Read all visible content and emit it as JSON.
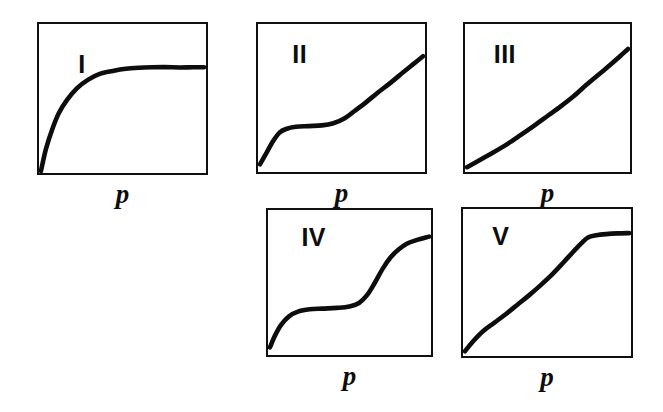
{
  "figure": {
    "background_color": "#ffffff",
    "line_color": "#0d0d0d",
    "width": 663,
    "height": 412
  },
  "panels": [
    {
      "id": "type-1",
      "label": "I",
      "axis_label": "p",
      "box": {
        "x": 37,
        "y": 22,
        "w": 171,
        "h": 153
      },
      "label_pos": {
        "x": 0.23,
        "y": 0.18
      },
      "axis_label_pos": {
        "x": 0.5,
        "y": 1.02
      }
    },
    {
      "id": "type-2",
      "label": "II",
      "axis_label": "p",
      "box": {
        "x": 256,
        "y": 22,
        "w": 171,
        "h": 152
      },
      "label_pos": {
        "x": 0.2,
        "y": 0.12
      },
      "axis_label_pos": {
        "x": 0.5,
        "y": 1.02
      }
    },
    {
      "id": "type-3",
      "label": "III",
      "axis_label": "p",
      "box": {
        "x": 463,
        "y": 22,
        "w": 169,
        "h": 152
      },
      "label_pos": {
        "x": 0.17,
        "y": 0.12
      },
      "axis_label_pos": {
        "x": 0.5,
        "y": 1.02
      }
    },
    {
      "id": "type-4",
      "label": "IV",
      "axis_label": "p",
      "box": {
        "x": 266,
        "y": 208,
        "w": 167,
        "h": 149
      },
      "label_pos": {
        "x": 0.2,
        "y": 0.1
      },
      "axis_label_pos": {
        "x": 0.5,
        "y": 1.02
      }
    },
    {
      "id": "type-5",
      "label": "V",
      "axis_label": "p",
      "box": {
        "x": 461,
        "y": 207,
        "w": 172,
        "h": 151
      },
      "label_pos": {
        "x": 0.17,
        "y": 0.1
      },
      "axis_label_pos": {
        "x": 0.5,
        "y": 1.02
      }
    }
  ],
  "chart_data": {
    "type": "line",
    "xlabel": "p",
    "ylabel": "",
    "xlim": [
      0,
      1
    ],
    "ylim": [
      0,
      1
    ],
    "grid": false,
    "legend": "none",
    "axis_tick_labels": {
      "x": [],
      "y": []
    },
    "annotations": [
      "I",
      "II",
      "III",
      "IV",
      "V"
    ],
    "series": [
      {
        "name": "Type I",
        "description": "Langmuir-type: steep initial uptake then horizontal plateau (microporous)",
        "x": [
          0.0,
          0.03,
          0.07,
          0.11,
          0.16,
          0.22,
          0.29,
          0.36,
          0.44,
          0.52,
          0.6,
          0.68,
          0.76,
          0.85,
          0.93,
          1.0
        ],
        "y": [
          0.0,
          0.15,
          0.29,
          0.4,
          0.49,
          0.57,
          0.63,
          0.67,
          0.69,
          0.705,
          0.712,
          0.715,
          0.716,
          0.714,
          0.715,
          0.715
        ]
      },
      {
        "name": "Type II",
        "description": "Sigmoidal with B-point knee then unrestricted multilayer rise (non-porous / macroporous)",
        "x": [
          0.0,
          0.04,
          0.08,
          0.12,
          0.16,
          0.22,
          0.3,
          0.38,
          0.45,
          0.52,
          0.58,
          0.65,
          0.72,
          0.8,
          0.88,
          0.94,
          1.0
        ],
        "y": [
          0.04,
          0.12,
          0.2,
          0.26,
          0.285,
          0.3,
          0.305,
          0.31,
          0.325,
          0.36,
          0.41,
          0.47,
          0.535,
          0.605,
          0.68,
          0.735,
          0.79
        ]
      },
      {
        "name": "Type III",
        "description": "Convex to the p axis throughout; weak adsorbent-adsorbate interaction",
        "x": [
          0.0,
          0.08,
          0.16,
          0.25,
          0.33,
          0.42,
          0.5,
          0.58,
          0.66,
          0.74,
          0.82,
          0.89,
          0.95,
          1.0
        ],
        "y": [
          0.02,
          0.07,
          0.12,
          0.18,
          0.24,
          0.31,
          0.375,
          0.44,
          0.51,
          0.59,
          0.665,
          0.73,
          0.79,
          0.84
        ]
      },
      {
        "name": "Type IV",
        "description": "Type II-like knee, plateau, then capillary-condensation step and final saturation plateau (mesoporous)",
        "x": [
          0.0,
          0.03,
          0.07,
          0.12,
          0.18,
          0.25,
          0.33,
          0.42,
          0.5,
          0.56,
          0.61,
          0.66,
          0.71,
          0.76,
          0.81,
          0.86,
          0.92,
          1.0
        ],
        "y": [
          0.04,
          0.12,
          0.2,
          0.26,
          0.295,
          0.31,
          0.315,
          0.32,
          0.33,
          0.355,
          0.41,
          0.5,
          0.6,
          0.68,
          0.735,
          0.775,
          0.8,
          0.825
        ]
      },
      {
        "name": "Type V",
        "description": "Type III-like at low p with a condensation step and saturation plateau (mesoporous, weak interaction)",
        "x": [
          0.0,
          0.05,
          0.11,
          0.18,
          0.25,
          0.32,
          0.39,
          0.46,
          0.53,
          0.6,
          0.66,
          0.71,
          0.75,
          0.8,
          0.86,
          0.93,
          1.0
        ],
        "y": [
          0.02,
          0.09,
          0.16,
          0.22,
          0.28,
          0.345,
          0.41,
          0.48,
          0.555,
          0.64,
          0.715,
          0.775,
          0.815,
          0.83,
          0.838,
          0.843,
          0.845
        ]
      }
    ]
  }
}
